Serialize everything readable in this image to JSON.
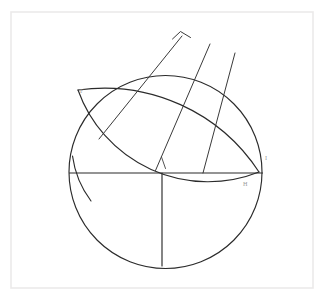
{
  "figure": {
    "background_color": "#ffffff",
    "frame": {
      "name": "page-border",
      "x": 11,
      "y": 12,
      "width": 302,
      "height": 276,
      "stroke_color": "#eceaea"
    },
    "ink_color": "#2b2b2b",
    "label_color": "#9a9a9a"
  },
  "labels": [
    {
      "id": "label-f",
      "text": "F",
      "x": 80,
      "y": 93
    },
    {
      "id": "label-i",
      "text": "I",
      "x": 265,
      "y": 160
    },
    {
      "id": "label-h",
      "text": "H",
      "x": 243,
      "y": 186
    }
  ],
  "shapes": {
    "main_circle": {
      "name": "main-circle",
      "cx": 165.5,
      "cy": 172.0,
      "r": 96.5,
      "note": "large circle; upper-left portion overdrawn by lens arcs"
    },
    "diameter_line": {
      "name": "horizontal-diameter",
      "x1": 69.5,
      "y1": 173.0,
      "x2": 262.5,
      "y2": 173.0
    },
    "vertical_radius": {
      "name": "vertical-radius",
      "x1": 162.0,
      "y1": 173.0,
      "x2": 162.0,
      "y2": 266.0
    },
    "lens_upper_arc": {
      "name": "lens-upper-arc",
      "start": [
        78.0,
        90.0
      ],
      "end": [
        259.0,
        172.0
      ],
      "radius": 185.0,
      "sweep": 1,
      "large_arc": 0
    },
    "lens_lower_arc": {
      "name": "lens-lower-arc",
      "start": [
        78.0,
        90.0
      ],
      "end": [
        259.0,
        172.0
      ],
      "radius": 138.0,
      "sweep": 0,
      "large_arc": 0
    },
    "radial_lines": [
      {
        "name": "radial-line-1",
        "x1": 99.0,
        "y1": 139.0,
        "x2": 182.0,
        "y2": 36.0
      },
      {
        "name": "radial-line-2",
        "x1": 155.5,
        "y1": 170.5,
        "x2": 210.0,
        "y2": 44.0
      },
      {
        "name": "radial-line-3",
        "x1": 203.0,
        "y1": 173.0,
        "x2": 235.0,
        "y2": 53.0
      }
    ],
    "caret_mark": {
      "name": "caret-angle-mark",
      "points": [
        [
          172.5,
          39.0
        ],
        [
          180.5,
          31.5
        ],
        [
          190.5,
          37.5
        ]
      ]
    },
    "arc_tick": {
      "name": "arc-tick-mark",
      "x1": 161.5,
      "y1": 157.0,
      "x2": 165.5,
      "y2": 168.5
    },
    "circle_left_tail": {
      "name": "circle-left-tail-arc",
      "start": [
        72.5,
        156.0
      ],
      "end": [
        91.0,
        201.0
      ],
      "radius": 96.5
    }
  }
}
